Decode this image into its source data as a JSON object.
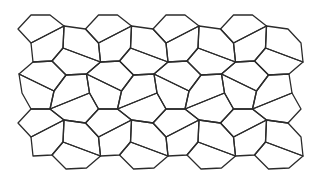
{
  "figure": {
    "stroke_color": "#2b2b2b",
    "background": "#ffffff",
    "period": {
      "dx": 67.5,
      "dy": 94
    },
    "vertices": {
      "A": [
        18,
        29
      ],
      "B": [
        31,
        15
      ],
      "C": [
        50,
        15
      ],
      "D": [
        64,
        26
      ],
      "E": [
        31,
        43
      ],
      "H": [
        63,
        48
      ],
      "F": [
        33,
        62
      ],
      "G": [
        52,
        61
      ],
      "P1": [
        19,
        74
      ],
      "P2": [
        54,
        91
      ],
      "P3": [
        66,
        75
      ],
      "P4": [
        22,
        93
      ]
    },
    "faces": {
      "f1": [
        [
          "A",
          0,
          0
        ],
        [
          "B",
          0,
          0
        ],
        [
          "C",
          0,
          0
        ],
        [
          "D",
          0,
          0
        ],
        [
          "E",
          0,
          0
        ]
      ],
      "f2": [
        [
          "E",
          0,
          0
        ],
        [
          "D",
          0,
          0
        ],
        [
          "H",
          0,
          0
        ],
        [
          "G",
          0,
          0
        ],
        [
          "F",
          0,
          0
        ]
      ],
      "f3": [
        [
          "D",
          0,
          0
        ],
        [
          "A",
          1,
          0
        ],
        [
          "E",
          1,
          0
        ],
        [
          "F",
          1,
          0
        ],
        [
          "H",
          0,
          0
        ]
      ],
      "f4": [
        [
          "F",
          0,
          0
        ],
        [
          "G",
          0,
          0
        ],
        [
          "P3",
          0,
          0
        ],
        [
          "P2",
          0,
          0
        ],
        [
          "P1",
          0,
          0
        ]
      ],
      "f5": [
        [
          "H",
          0,
          0
        ],
        [
          "F",
          1,
          0
        ],
        [
          "P1",
          1,
          0
        ],
        [
          "P3",
          0,
          0
        ],
        [
          "G",
          0,
          0
        ]
      ],
      "f6": [
        [
          "P1",
          0,
          0
        ],
        [
          "P2",
          0,
          0
        ],
        [
          "C",
          0,
          1
        ],
        [
          "B",
          0,
          1
        ],
        [
          "P4",
          0,
          0
        ]
      ],
      "f7": [
        [
          "P2",
          0,
          0
        ],
        [
          "P3",
          0,
          0
        ],
        [
          "P1",
          1,
          0
        ],
        [
          "P4",
          1,
          0
        ],
        [
          "C",
          0,
          1
        ]
      ],
      "f8": [
        [
          "P4",
          0,
          0
        ],
        [
          "B",
          0,
          1
        ],
        [
          "A",
          0,
          1
        ],
        [
          "D",
          -1,
          1
        ],
        [
          "C",
          -1,
          1
        ]
      ]
    },
    "placements": [
      [
        "f1",
        0,
        0
      ],
      [
        "f1",
        1,
        0
      ],
      [
        "f1",
        2,
        0
      ],
      [
        "f1",
        3,
        0
      ],
      [
        "f2",
        0,
        0
      ],
      [
        "f2",
        1,
        0
      ],
      [
        "f2",
        2,
        0
      ],
      [
        "f2",
        3,
        0
      ],
      [
        "f3",
        0,
        0
      ],
      [
        "f3",
        1,
        0
      ],
      [
        "f3",
        2,
        0
      ],
      [
        "f3",
        3,
        0
      ],
      [
        "f4",
        0,
        0
      ],
      [
        "f4",
        1,
        0
      ],
      [
        "f4",
        2,
        0
      ],
      [
        "f4",
        3,
        0
      ],
      [
        "f5",
        0,
        0
      ],
      [
        "f5",
        1,
        0
      ],
      [
        "f5",
        2,
        0
      ],
      [
        "f5",
        3,
        0
      ],
      [
        "f6",
        0,
        0
      ],
      [
        "f6",
        1,
        0
      ],
      [
        "f6",
        2,
        0
      ],
      [
        "f6",
        3,
        0
      ],
      [
        "f7",
        0,
        0
      ],
      [
        "f7",
        1,
        0
      ],
      [
        "f7",
        2,
        0
      ],
      [
        "f7",
        3,
        0
      ],
      [
        "f8",
        1,
        0
      ],
      [
        "f8",
        2,
        0
      ],
      [
        "f8",
        3,
        0
      ],
      [
        "f8",
        4,
        0
      ],
      [
        "f1",
        0,
        1
      ],
      [
        "f1",
        1,
        1
      ],
      [
        "f1",
        2,
        1
      ],
      [
        "f1",
        3,
        1
      ],
      [
        "f2",
        0,
        1
      ],
      [
        "f2",
        1,
        1
      ],
      [
        "f2",
        2,
        1
      ],
      [
        "f2",
        3,
        1
      ],
      [
        "f3",
        0,
        1
      ],
      [
        "f3",
        1,
        1
      ],
      [
        "f3",
        2,
        1
      ],
      [
        "f3",
        3,
        1
      ],
      [
        "f5",
        0,
        1
      ],
      [
        "f5",
        1,
        1
      ],
      [
        "f5",
        2,
        1
      ],
      [
        "f5",
        3,
        1
      ]
    ]
  }
}
